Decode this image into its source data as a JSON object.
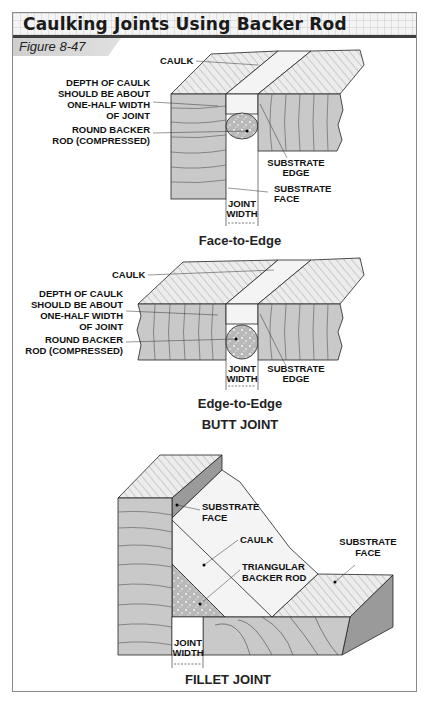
{
  "title": "Caulking Joints Using Backer Rod",
  "figure_label": "Figure 8-47",
  "colors": {
    "wood_face": "#c9c9c9",
    "wood_top": "#e6e6e6",
    "grain": "#555555",
    "caulk": "#f4f4f4",
    "backer_rod": "#b8b8b8",
    "outline": "#222222",
    "title_rule": "#3d3d3d"
  },
  "panels": {
    "face_to_edge": {
      "caption": "Face-to-Edge",
      "labels": {
        "caulk": "CAULK",
        "depth_1": "DEPTH OF CAULK",
        "depth_2": "SHOULD BE ABOUT",
        "depth_3": "ONE-HALF WIDTH",
        "depth_4": "OF JOINT",
        "rod_1": "ROUND BACKER",
        "rod_2": "ROD (COMPRESSED)",
        "edge_1": "SUBSTRATE",
        "edge_2": "EDGE",
        "face_1": "SUBSTRATE",
        "face_2": "FACE",
        "width_1": "JOINT",
        "width_2": "WIDTH"
      }
    },
    "edge_to_edge": {
      "caption": "Edge-to-Edge",
      "group_caption": "BUTT JOINT",
      "labels": {
        "caulk": "CAULK",
        "depth_1": "DEPTH OF CAULK",
        "depth_2": "SHOULD BE ABOUT",
        "depth_3": "ONE-HALF WIDTH",
        "depth_4": "OF JOINT",
        "rod_1": "ROUND BACKER",
        "rod_2": "ROD (COMPRESSED)",
        "width_1": "JOINT",
        "width_2": "WIDTH",
        "edge_1": "SUBSTRATE",
        "edge_2": "EDGE"
      }
    },
    "fillet": {
      "caption": "FILLET JOINT",
      "labels": {
        "face_a_1": "SUBSTRATE",
        "face_a_2": "FACE",
        "caulk": "CAULK",
        "rod_1": "TRIANGULAR",
        "rod_2": "BACKER ROD",
        "face_b_1": "SUBSTRATE",
        "face_b_2": "FACE",
        "width_1": "JOINT",
        "width_2": "WIDTH"
      }
    }
  }
}
